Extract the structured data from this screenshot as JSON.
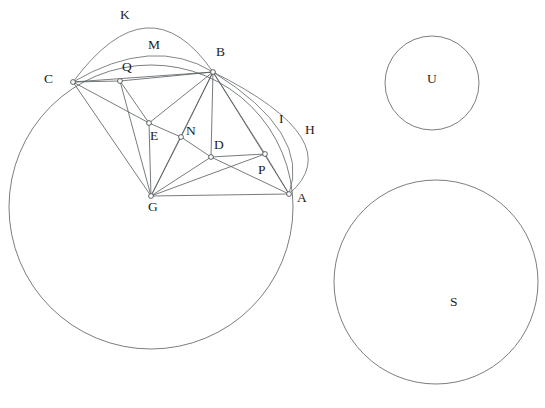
{
  "figure": {
    "background_color": "#ffffff",
    "line_color": "#555a5e",
    "arc_color": "#6a6f73",
    "label_color": "#1d1d1d",
    "width": 545,
    "height": 408
  },
  "points": [
    {
      "id": "C",
      "label": "C",
      "x": 73,
      "y": 82,
      "label_x": 44,
      "label_y": 72
    },
    {
      "id": "Q",
      "label": "Q",
      "x": 120,
      "y": 81,
      "label_x": 122,
      "label_y": 60
    },
    {
      "id": "B",
      "label": "B",
      "x": 213,
      "y": 72,
      "label_x": 216,
      "label_y": 45
    },
    {
      "id": "E",
      "label": "E",
      "x": 149,
      "y": 123,
      "label_x": 150,
      "label_y": 129
    },
    {
      "id": "N",
      "label": "N",
      "x": 181,
      "y": 137,
      "label_x": 186,
      "label_y": 124
    },
    {
      "id": "D",
      "label": "D",
      "x": 211,
      "y": 157,
      "label_x": 214,
      "label_y": 138
    },
    {
      "id": "P",
      "label": "P",
      "x": 265,
      "y": 154,
      "label_x": 258,
      "label_y": 163
    },
    {
      "id": "G",
      "label": "G",
      "x": 151,
      "y": 196,
      "label_x": 148,
      "label_y": 200
    },
    {
      "id": "A",
      "label": "A",
      "x": 289,
      "y": 194,
      "label_x": 297,
      "label_y": 191
    }
  ],
  "region_labels": [
    {
      "id": "K",
      "label": "K",
      "x": 120,
      "y": 8
    },
    {
      "id": "M",
      "label": "M",
      "x": 148,
      "y": 38
    },
    {
      "id": "I",
      "label": "I",
      "x": 279,
      "y": 112
    },
    {
      "id": "H",
      "label": "H",
      "x": 305,
      "y": 123
    },
    {
      "id": "U",
      "label": "U",
      "x": 427,
      "y": 72
    },
    {
      "id": "S",
      "label": "S",
      "x": 450,
      "y": 295
    }
  ],
  "segments": [
    {
      "id": "CQ",
      "from": "C",
      "to": "Q"
    },
    {
      "id": "CB",
      "from": "C",
      "to": "B"
    },
    {
      "id": "CE",
      "from": "C",
      "to": "E"
    },
    {
      "id": "CG",
      "from": "C",
      "to": "G"
    },
    {
      "id": "QE",
      "from": "Q",
      "to": "E"
    },
    {
      "id": "QG",
      "from": "Q",
      "to": "G"
    },
    {
      "id": "QB",
      "from": "Q",
      "to": "B"
    },
    {
      "id": "BE",
      "from": "B",
      "to": "E"
    },
    {
      "id": "BN",
      "from": "B",
      "to": "N"
    },
    {
      "id": "BD",
      "from": "B",
      "to": "D"
    },
    {
      "id": "BG",
      "from": "B",
      "to": "G"
    },
    {
      "id": "BP",
      "from": "B",
      "to": "P"
    },
    {
      "id": "BA",
      "from": "B",
      "to": "A"
    },
    {
      "id": "EN",
      "from": "E",
      "to": "N"
    },
    {
      "id": "EG",
      "from": "E",
      "to": "G"
    },
    {
      "id": "ND",
      "from": "N",
      "to": "D"
    },
    {
      "id": "NG",
      "from": "N",
      "to": "G"
    },
    {
      "id": "DP",
      "from": "D",
      "to": "P"
    },
    {
      "id": "DG",
      "from": "D",
      "to": "G"
    },
    {
      "id": "DA",
      "from": "D",
      "to": "A"
    },
    {
      "id": "PG",
      "from": "P",
      "to": "G"
    },
    {
      "id": "PA",
      "from": "P",
      "to": "A"
    },
    {
      "id": "GA",
      "from": "G",
      "to": "A"
    }
  ],
  "arcs": [
    {
      "id": "arc-K",
      "label": "K",
      "from": "C",
      "to": "B",
      "bulge_x": 146,
      "bulge_y": 28
    },
    {
      "id": "arc-M",
      "label": "M",
      "from": "C",
      "to": "B",
      "bulge_x": 148,
      "bulge_y": 56
    },
    {
      "id": "arc-I",
      "label": "I",
      "from": "B",
      "to": "A",
      "bulge_x": 281,
      "bulge_y": 133
    },
    {
      "id": "arc-H",
      "label": "H",
      "from": "B",
      "to": "A",
      "bulge_x": 301,
      "bulge_y": 137
    }
  ],
  "circles": [
    {
      "id": "big-circle",
      "label": "",
      "cx": 151,
      "cy": 207,
      "r": 142
    },
    {
      "id": "circle-U",
      "label": "U",
      "cx": 432,
      "cy": 83,
      "r": 47
    },
    {
      "id": "circle-S",
      "label": "S",
      "cx": 436,
      "cy": 282,
      "r": 102
    }
  ],
  "vertex_radius": 2.4
}
